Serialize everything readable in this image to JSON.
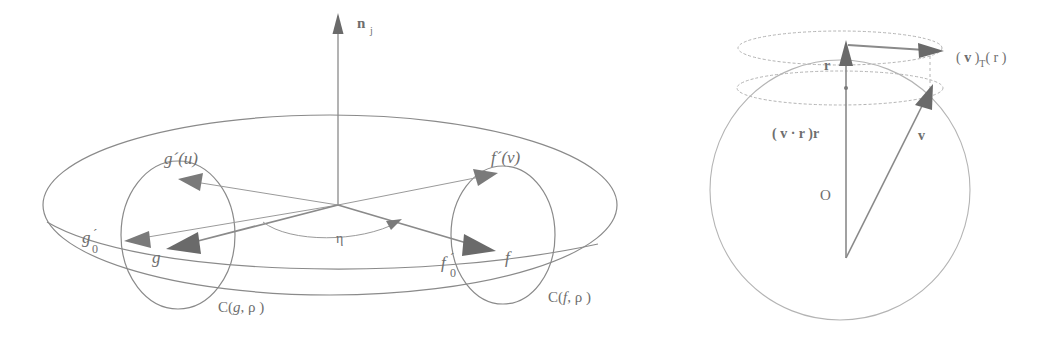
{
  "figure": {
    "title": "",
    "background_color": "#ffffff",
    "line_color": "#8a8a8a",
    "faint_line_color": "#b4b4b4",
    "text_color": "#6e6e6e",
    "arrow_fill": "#6a6a6a",
    "panels": [
      {
        "id": "left",
        "name": "tangent-plane-diagram"
      },
      {
        "id": "right",
        "name": "sphere-tangential-projection-diagram"
      }
    ]
  },
  "left_panel": {
    "name": "tangent-plane-diagram",
    "labels": {
      "normal_vector": "n",
      "normal_vector_sub": "j",
      "g_prime_u": "g´(u)",
      "f_prime_v": "f´(v)",
      "g_zero_prime": "g",
      "g_zero_prime_sub": "0",
      "g_zero_prime_mark": "´",
      "f_zero_prime": "f",
      "f_zero_prime_sub": "0",
      "f_zero_prime_mark": "´",
      "g": "g",
      "f": "f",
      "eta": "η",
      "circle_g": "C(",
      "circle_g_arg": "g",
      "circle_g_rho": ", ρ )",
      "circle_f": "C(",
      "circle_f_arg": "f",
      "circle_f_rho": ", ρ )"
    }
  },
  "right_panel": {
    "name": "sphere-tangential-projection-diagram",
    "labels": {
      "origin": "O",
      "r_vector": "r",
      "v_vector": "v",
      "projection_normal": "( v · r )r",
      "projection_tangential_open": "( ",
      "projection_tangential_v": "v",
      "projection_tangential_mid": " )",
      "projection_tangential_sub": "T",
      "projection_tangential_tail": "( r )"
    }
  }
}
